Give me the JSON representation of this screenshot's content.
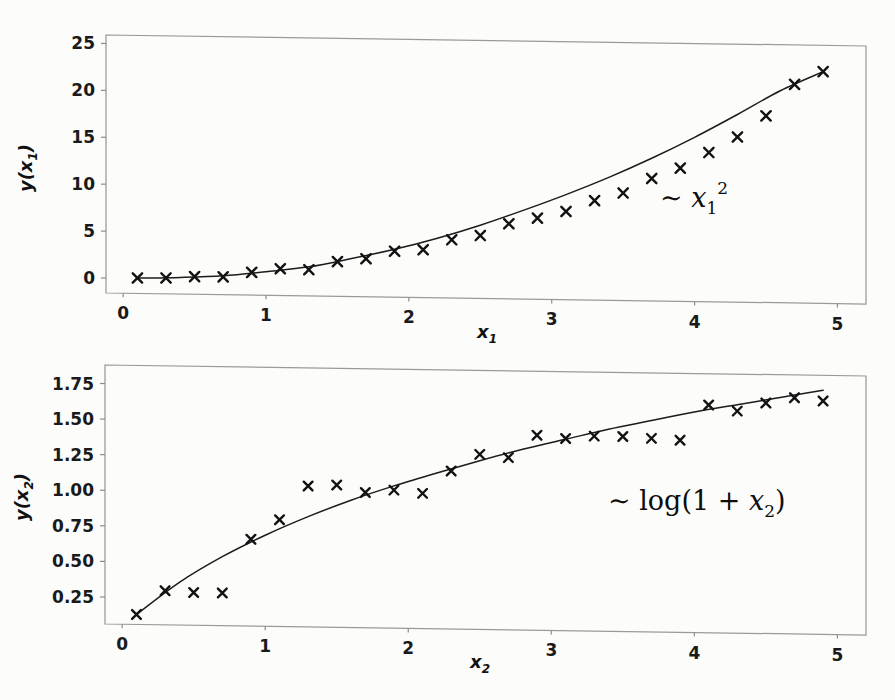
{
  "figure": {
    "background_color": "#fcfcfa",
    "ink_color": "#121212",
    "frame_color": "#9a9a9a"
  },
  "chart_data": [
    {
      "id": "top-panel",
      "type": "scatter",
      "title": "",
      "xlabel": "x_1",
      "xlabel_text": "x",
      "xlabel_sub": "1",
      "ylabel": "y(x_1)",
      "ylabel_prefix": "y(",
      "ylabel_var": "x",
      "ylabel_sub": "1",
      "ylabel_suffix": ")",
      "annotation": "~ x_1^2",
      "annotation_parts": {
        "tilde": "∼",
        "var": "x",
        "sub": "1",
        "sup": "2"
      },
      "xlim": [
        -0.12,
        5.2
      ],
      "ylim": [
        -1.6,
        25.9
      ],
      "xticks": [
        0,
        1,
        2,
        3,
        4,
        5
      ],
      "xtick_labels": [
        "0",
        "1",
        "2",
        "3",
        "4",
        "5"
      ],
      "yticks": [
        0,
        5,
        10,
        15,
        20,
        25
      ],
      "ytick_labels": [
        "0",
        "5",
        "10",
        "15",
        "20",
        "25"
      ],
      "grid": false,
      "legend": "none",
      "marker": "x",
      "x": [
        0.1,
        0.3,
        0.5,
        0.7,
        0.9,
        1.1,
        1.3,
        1.5,
        1.7,
        1.9,
        2.1,
        2.3,
        2.5,
        2.7,
        2.9,
        3.1,
        3.3,
        3.5,
        3.7,
        3.9,
        4.1,
        4.3,
        4.5,
        4.7,
        4.9
      ],
      "values": [
        0.05,
        0.1,
        0.28,
        0.3,
        0.82,
        1.25,
        1.2,
        2.1,
        2.45,
        3.3,
        3.5,
        4.6,
        5.1,
        6.4,
        7.05,
        7.8,
        9.0,
        9.85,
        11.45,
        12.6,
        14.3,
        14.5,
        16.0,
        18.3,
        19.6,
        21.7,
        23.1
      ],
      "y": [
        0.05,
        0.1,
        0.28,
        0.3,
        0.82,
        1.25,
        1.2,
        2.1,
        2.45,
        3.3,
        3.5,
        4.6,
        5.1,
        6.4,
        7.05,
        7.8,
        9.0,
        9.85,
        11.45,
        12.6,
        14.3,
        16.0,
        18.3,
        21.7,
        23.1
      ],
      "fit_curve": {
        "label": "x^2 fit",
        "x": [
          0.1,
          0.4,
          0.7,
          1.0,
          1.3,
          1.6,
          1.9,
          2.2,
          2.5,
          2.8,
          3.1,
          3.4,
          3.7,
          4.0,
          4.3,
          4.6,
          4.9
        ],
        "y": [
          0.05,
          0.18,
          0.42,
          0.92,
          1.5,
          2.45,
          3.5,
          4.75,
          6.2,
          7.85,
          9.6,
          11.5,
          13.6,
          15.9,
          18.4,
          21.0,
          23.1
        ]
      }
    },
    {
      "id": "bottom-panel",
      "type": "scatter",
      "title": "",
      "xlabel": "x_2",
      "xlabel_text": "x",
      "xlabel_sub": "2",
      "ylabel": "y(x_2)",
      "ylabel_prefix": "y(",
      "ylabel_var": "x",
      "ylabel_sub": "2",
      "ylabel_suffix": ")",
      "annotation": "~ log(1 + x_2)",
      "annotation_parts": {
        "tilde": "∼",
        "fn": "log(1 +",
        "var": "x",
        "sub": "2",
        "close": ")"
      },
      "xlim": [
        -0.12,
        5.2
      ],
      "ylim": [
        0.06,
        1.88
      ],
      "xticks": [
        0,
        1,
        2,
        3,
        4,
        5
      ],
      "xtick_labels": [
        "0",
        "1",
        "2",
        "3",
        "4",
        "5"
      ],
      "yticks": [
        0.25,
        0.5,
        0.75,
        1.0,
        1.25,
        1.5,
        1.75
      ],
      "ytick_labels": [
        "0.25",
        "0.50",
        "0.75",
        "1.00",
        "1.25",
        "1.50",
        "1.75"
      ],
      "grid": false,
      "legend": "none",
      "marker": "x",
      "x": [
        0.1,
        0.3,
        0.5,
        0.7,
        0.9,
        1.1,
        1.3,
        1.5,
        1.7,
        1.9,
        2.1,
        2.3,
        2.5,
        2.7,
        2.9,
        3.1,
        3.3,
        3.5,
        3.7,
        3.9,
        4.1,
        4.3,
        4.5,
        4.7,
        4.9
      ],
      "y": [
        0.13,
        0.3,
        0.29,
        0.29,
        0.67,
        0.81,
        1.05,
        1.06,
        1.01,
        1.03,
        1.01,
        1.17,
        1.29,
        1.27,
        1.43,
        1.41,
        1.43,
        1.43,
        1.42,
        1.41,
        1.66,
        1.62,
        1.68,
        1.72,
        1.7
      ],
      "values": [
        0.13,
        0.3,
        0.29,
        0.29,
        0.67,
        0.81,
        1.05,
        1.06,
        1.01,
        1.03,
        1.01,
        1.17,
        1.29,
        1.27,
        1.43,
        1.41,
        1.43,
        1.43,
        1.42,
        1.41,
        1.66,
        1.62,
        1.68,
        1.72,
        1.7
      ],
      "fit_curve": {
        "label": "log(1+x) fit",
        "x": [
          0.1,
          0.4,
          0.7,
          1.0,
          1.3,
          1.6,
          1.9,
          2.2,
          2.5,
          2.8,
          3.1,
          3.4,
          3.7,
          4.0,
          4.3,
          4.6,
          4.9
        ],
        "y": [
          0.13,
          0.36,
          0.545,
          0.7,
          0.835,
          0.955,
          1.06,
          1.155,
          1.245,
          1.33,
          1.405,
          1.48,
          1.545,
          1.61,
          1.665,
          1.72,
          1.775
        ]
      }
    }
  ]
}
